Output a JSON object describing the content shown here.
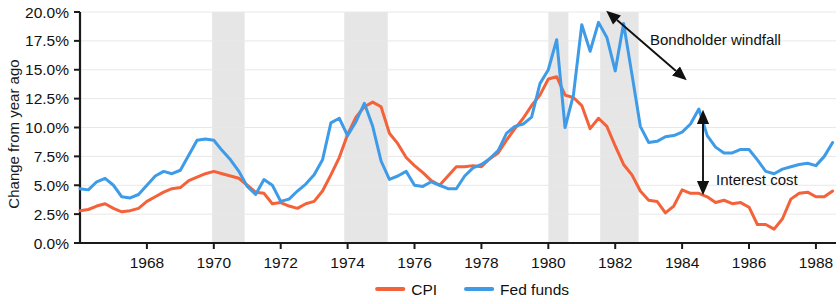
{
  "chart_data": {
    "type": "line",
    "title": "",
    "xlabel": "",
    "ylabel": "Change from year ago",
    "xlim": [
      1966.0,
      1988.6
    ],
    "ylim": [
      0.0,
      20.0
    ],
    "grid": true,
    "legend_position": "bottom-center",
    "y_ticks": [
      "0.0%",
      "2.5%",
      "5.0%",
      "7.5%",
      "10.0%",
      "12.5%",
      "15.0%",
      "17.5%",
      "20.0%"
    ],
    "y_tick_values": [
      0.0,
      2.5,
      5.0,
      7.5,
      10.0,
      12.5,
      15.0,
      17.5,
      20.0
    ],
    "x_ticks": [
      "1968",
      "1970",
      "1972",
      "1974",
      "1976",
      "1978",
      "1980",
      "1982",
      "1984",
      "1986",
      "1988"
    ],
    "x_tick_values": [
      1968,
      1970,
      1972,
      1974,
      1976,
      1978,
      1980,
      1982,
      1984,
      1986,
      1988
    ],
    "colors": {
      "cpi": "#F4623A",
      "fed_funds": "#3E9BE8",
      "recession_band": "#E2E2E2",
      "gridline": "#E8E8E8",
      "axis": "#1A1A1A",
      "text": "#111111"
    },
    "series": [
      {
        "name": "CPI",
        "color": "#F4623A",
        "x": [
          1966.0,
          1966.25,
          1966.5,
          1966.75,
          1967.0,
          1967.25,
          1967.5,
          1967.75,
          1968.0,
          1968.25,
          1968.5,
          1968.75,
          1969.0,
          1969.25,
          1969.5,
          1969.75,
          1970.0,
          1970.25,
          1970.5,
          1970.75,
          1971.0,
          1971.25,
          1971.5,
          1971.75,
          1972.0,
          1972.25,
          1972.5,
          1972.75,
          1973.0,
          1973.25,
          1973.5,
          1973.75,
          1974.0,
          1974.25,
          1974.5,
          1974.75,
          1975.0,
          1975.25,
          1975.5,
          1975.75,
          1976.0,
          1976.25,
          1976.5,
          1976.75,
          1977.0,
          1977.25,
          1977.5,
          1977.75,
          1978.0,
          1978.25,
          1978.5,
          1978.75,
          1979.0,
          1979.25,
          1979.5,
          1979.75,
          1980.0,
          1980.25,
          1980.5,
          1980.75,
          1981.0,
          1981.25,
          1981.5,
          1981.75,
          1982.0,
          1982.25,
          1982.5,
          1982.75,
          1983.0,
          1983.25,
          1983.5,
          1983.75,
          1984.0,
          1984.25,
          1984.5,
          1984.75,
          1985.0,
          1985.25,
          1985.5,
          1985.75,
          1986.0,
          1986.25,
          1986.5,
          1986.75,
          1987.0,
          1987.25,
          1987.5,
          1987.75,
          1988.0,
          1988.25,
          1988.5
        ],
        "y": [
          2.8,
          2.9,
          3.2,
          3.4,
          3.0,
          2.7,
          2.8,
          3.0,
          3.6,
          4.0,
          4.4,
          4.7,
          4.8,
          5.4,
          5.7,
          6.0,
          6.2,
          6.0,
          5.8,
          5.6,
          5.0,
          4.4,
          4.3,
          3.4,
          3.5,
          3.2,
          3.0,
          3.4,
          3.6,
          4.5,
          5.9,
          7.4,
          9.4,
          10.9,
          11.8,
          12.2,
          11.8,
          9.5,
          8.6,
          7.4,
          6.7,
          6.1,
          5.4,
          5.0,
          5.8,
          6.6,
          6.6,
          6.7,
          6.6,
          7.3,
          7.8,
          8.9,
          9.9,
          10.8,
          11.9,
          12.8,
          14.2,
          14.4,
          12.8,
          12.6,
          11.9,
          9.9,
          10.8,
          10.1,
          8.4,
          6.8,
          5.9,
          4.5,
          3.7,
          3.6,
          2.6,
          3.2,
          4.6,
          4.3,
          4.3,
          4.0,
          3.5,
          3.7,
          3.4,
          3.5,
          3.1,
          1.6,
          1.6,
          1.2,
          2.1,
          3.8,
          4.3,
          4.4,
          4.0,
          4.0,
          4.5
        ]
      },
      {
        "name": "Fed funds",
        "color": "#3E9BE8",
        "x": [
          1966.0,
          1966.25,
          1966.5,
          1966.75,
          1967.0,
          1967.25,
          1967.5,
          1967.75,
          1968.0,
          1968.25,
          1968.5,
          1968.75,
          1969.0,
          1969.25,
          1969.5,
          1969.75,
          1970.0,
          1970.25,
          1970.5,
          1970.75,
          1971.0,
          1971.25,
          1971.5,
          1971.75,
          1972.0,
          1972.25,
          1972.5,
          1972.75,
          1973.0,
          1973.25,
          1973.5,
          1973.75,
          1974.0,
          1974.25,
          1974.5,
          1974.75,
          1975.0,
          1975.25,
          1975.5,
          1975.75,
          1976.0,
          1976.25,
          1976.5,
          1976.75,
          1977.0,
          1977.25,
          1977.5,
          1977.75,
          1978.0,
          1978.25,
          1978.5,
          1978.75,
          1979.0,
          1979.25,
          1979.5,
          1979.75,
          1980.0,
          1980.25,
          1980.5,
          1980.75,
          1981.0,
          1981.25,
          1981.5,
          1981.75,
          1982.0,
          1982.25,
          1982.5,
          1982.75,
          1983.0,
          1983.25,
          1983.5,
          1983.75,
          1984.0,
          1984.25,
          1984.5,
          1984.75,
          1985.0,
          1985.25,
          1985.5,
          1985.75,
          1986.0,
          1986.25,
          1986.5,
          1986.75,
          1987.0,
          1987.25,
          1987.5,
          1987.75,
          1988.0,
          1988.25,
          1988.5
        ],
        "y": [
          4.7,
          4.6,
          5.3,
          5.6,
          5.0,
          4.0,
          3.9,
          4.2,
          5.0,
          5.8,
          6.2,
          6.0,
          6.3,
          7.6,
          8.9,
          9.0,
          8.9,
          8.0,
          7.2,
          6.2,
          4.9,
          4.2,
          5.5,
          5.0,
          3.6,
          3.8,
          4.5,
          5.1,
          5.9,
          7.2,
          10.4,
          10.8,
          9.3,
          10.5,
          12.1,
          10.1,
          7.1,
          5.5,
          5.8,
          6.2,
          5.0,
          4.9,
          5.3,
          5.0,
          4.7,
          4.7,
          5.8,
          6.5,
          6.8,
          7.3,
          8.0,
          9.5,
          10.1,
          10.3,
          10.9,
          13.8,
          15.0,
          17.6,
          10.0,
          12.8,
          18.9,
          16.6,
          19.1,
          17.8,
          14.9,
          19.0,
          14.6,
          10.1,
          8.7,
          8.8,
          9.2,
          9.3,
          9.6,
          10.3,
          11.6,
          9.3,
          8.3,
          7.8,
          7.8,
          8.1,
          8.1,
          7.2,
          6.2,
          6.0,
          6.4,
          6.6,
          6.8,
          6.9,
          6.7,
          7.5,
          8.7
        ]
      }
    ],
    "recession_bands": [
      {
        "start": 1969.95,
        "end": 1970.92
      },
      {
        "start": 1973.9,
        "end": 1975.2
      },
      {
        "start": 1980.0,
        "end": 1980.6
      },
      {
        "start": 1981.55,
        "end": 1982.7
      }
    ],
    "annotations": [
      {
        "id": "bondholder-windfall",
        "text": "Bondholder windfall",
        "arrow": "double-headed-diagonal"
      },
      {
        "id": "interest-cost",
        "text": "Interest cost",
        "arrow": "double-headed-vertical"
      }
    ]
  },
  "legend": {
    "items": [
      {
        "label": "CPI",
        "color": "#F4623A"
      },
      {
        "label": "Fed funds",
        "color": "#3E9BE8"
      }
    ]
  }
}
